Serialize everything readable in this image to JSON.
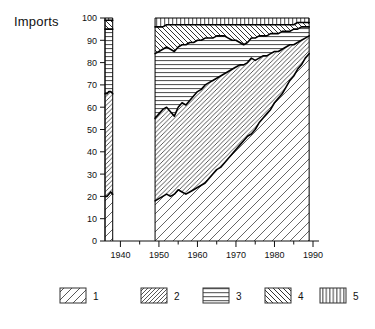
{
  "chart_data": {
    "type": "area",
    "title": "Imports",
    "ylabel": "Imports",
    "xlabel": "",
    "ylim": [
      0,
      100
    ],
    "xlim": [
      1936,
      1990
    ],
    "yticks": [
      0,
      10,
      20,
      30,
      40,
      50,
      60,
      70,
      80,
      90,
      100
    ],
    "xticks": [
      1940,
      1950,
      1960,
      1970,
      1980,
      1990
    ],
    "xminorticks": [
      1935,
      1945,
      1955,
      1965,
      1975,
      1985
    ],
    "grid": false,
    "stacked": true,
    "stack_total": 100,
    "legend_position": "bottom",
    "note": "Stacked percentage area chart with a data gap between 1938 and 1949.",
    "legend": [
      {
        "key": "1",
        "label": "1",
        "pattern": "diagonal-forward-wide"
      },
      {
        "key": "2",
        "label": "2",
        "pattern": "diagonal-forward-dense"
      },
      {
        "key": "3",
        "label": "3",
        "pattern": "horizontal-lines"
      },
      {
        "key": "4",
        "label": "4",
        "pattern": "diagonal-back"
      },
      {
        "key": "5",
        "label": "5",
        "pattern": "vertical-lines"
      }
    ],
    "segments": [
      {
        "name": "early",
        "x": [
          1936,
          1936.5,
          1937,
          1937.5,
          1938
        ],
        "cum": {
          "1": [
            20,
            20,
            21,
            22,
            21
          ],
          "2": [
            66,
            66,
            67,
            67,
            66
          ],
          "3": [
            95,
            95,
            95,
            95,
            95
          ],
          "4": [
            99,
            99,
            99,
            99,
            99
          ],
          "5": [
            100,
            100,
            100,
            100,
            100
          ]
        }
      },
      {
        "name": "postwar",
        "x": [
          1949,
          1950,
          1951,
          1952,
          1953,
          1954,
          1955,
          1956,
          1957,
          1958,
          1959,
          1960,
          1961,
          1962,
          1963,
          1964,
          1965,
          1966,
          1967,
          1968,
          1969,
          1970,
          1971,
          1972,
          1973,
          1974,
          1975,
          1976,
          1977,
          1978,
          1979,
          1980,
          1981,
          1982,
          1983,
          1984,
          1985,
          1986,
          1987,
          1988,
          1989
        ],
        "cum": {
          "1": [
            18,
            19,
            20,
            21,
            20,
            21,
            23,
            22,
            21,
            22,
            23,
            24,
            25,
            26,
            28,
            30,
            32,
            33,
            35,
            37,
            39,
            41,
            43,
            45,
            47,
            48,
            50,
            53,
            55,
            57,
            59,
            62,
            64,
            66,
            69,
            72,
            74,
            77,
            79,
            82,
            84
          ],
          "2": [
            55,
            57,
            59,
            60,
            58,
            56,
            60,
            62,
            61,
            63,
            65,
            67,
            68,
            70,
            71,
            72,
            73,
            74,
            75,
            76,
            77,
            78,
            79,
            79,
            80,
            82,
            81,
            82,
            83,
            83,
            84,
            85,
            85,
            86,
            87,
            88,
            88,
            89,
            90,
            91,
            92
          ],
          "3": [
            84,
            85,
            86,
            87,
            86,
            85,
            87,
            88,
            88,
            89,
            89,
            90,
            90,
            91,
            91,
            91,
            92,
            92,
            92,
            91,
            90,
            90,
            89,
            88,
            89,
            91,
            91,
            92,
            92,
            92,
            93,
            93,
            93,
            94,
            94,
            94,
            95,
            95,
            96,
            96,
            96
          ],
          "4": [
            96,
            96,
            96,
            97,
            97,
            97,
            97,
            97,
            97,
            97,
            97,
            97,
            97,
            97,
            97,
            97,
            97,
            97,
            97,
            97,
            97,
            97,
            97,
            97,
            97,
            97,
            97,
            97,
            97,
            97,
            97,
            97,
            97,
            97,
            97,
            97,
            97,
            98,
            98,
            98,
            98
          ],
          "5": [
            100,
            100,
            100,
            100,
            100,
            100,
            100,
            100,
            100,
            100,
            100,
            100,
            100,
            100,
            100,
            100,
            100,
            100,
            100,
            100,
            100,
            100,
            100,
            100,
            100,
            100,
            100,
            100,
            100,
            100,
            100,
            100,
            100,
            100,
            100,
            100,
            100,
            100,
            100,
            100,
            100
          ]
        }
      }
    ]
  },
  "axis": {
    "y_labels": [
      "100",
      "90",
      "80",
      "70",
      "60",
      "50",
      "40",
      "30",
      "20",
      "10",
      "0"
    ],
    "x_labels": [
      "1940",
      "1950",
      "1960",
      "1970",
      "1980",
      "1990"
    ]
  },
  "legend": {
    "items": [
      {
        "label": "1"
      },
      {
        "label": "2"
      },
      {
        "label": "3"
      },
      {
        "label": "4"
      },
      {
        "label": "5"
      }
    ]
  },
  "colors": {
    "ink": "#111111",
    "line": "#000000",
    "background": "#ffffff"
  }
}
